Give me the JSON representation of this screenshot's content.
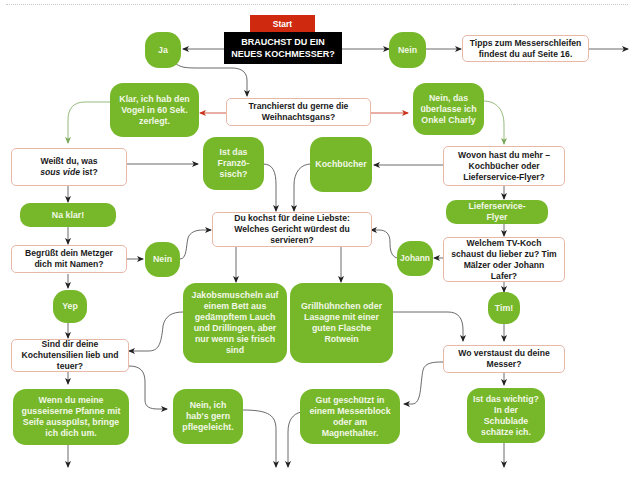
{
  "flowchart": {
    "start_label": "Start",
    "main_question": "BRAUCHST DU EIN NEUES KOCHMESSER?",
    "colors": {
      "start": "#cf2a10",
      "main_question_bg": "#000000",
      "answer_bubble": "#76b82a",
      "question_border": "#e9b7a8",
      "arrow": "#333333",
      "arrow_red": "#c8331a",
      "arrow_green": "#7aa85a"
    },
    "nodes": {
      "ja": "Ja",
      "nein_top": "Nein",
      "tipps": "Tipps zum Messerschleifen findest du auf Seite 16.",
      "tranchierst": "Tranchierst du gerne die Weihnachtsgans?",
      "klar_vogel": "Klar, ich hab den Vogel in 60 Sek. zerlegt.",
      "nein_onkel": "Nein, das überlasse ich Onkel Charly",
      "weisst_du_pre": "Weißt du, was",
      "weisst_du_italic": "sous vide",
      "weisst_du_post": "ist?",
      "ist_das_franzoesisch": "Ist das Franzö-sisch?",
      "kochbuecher": "Kochbücher",
      "wovon_hast_du": "Wovon hast du mehr – Kochbücher oder Lieferservice-Flyer?",
      "na_klar": "Na klar!",
      "du_kochst": "Du kochst für deine Liebste: Welches Gericht würdest du servieren?",
      "lieferservice_flyer": "Lieferservice-Flyer",
      "begruesst": "Begrüßt dein Metzger dich mit Namen?",
      "nein_metzger": "Nein",
      "johann": "Johann",
      "welchem_tv_koch": "Welchem TV-Koch schaust du lieber zu? Tim Mälzer oder Johann Lafer?",
      "yep": "Yep",
      "jakobsmuscheln": "Jakobsmuscheln auf einem Bett aus gedämpftem Lauch und Drillingen, aber nur wenn sie frisch sind",
      "grillhuehnchen": "Grillhühnchen oder Lasagne mit einer guten Flasche Rotwein",
      "tim": "Tim!",
      "sind_dir": "Sind dir deine Kochutensilien lieb und teuer?",
      "wo_verstaust": "Wo verstaust du deine Messer?",
      "wenn_du_meine": "Wenn du meine gusseiserne Pfanne mit Seife ausspülst, bringe ich dich um.",
      "nein_pflegeleicht": "Nein, ich hab's gern pflegeleicht.",
      "gut_geschuetzt": "Gut geschützt in einem Messerblock oder am Magnethalter.",
      "ist_das_wichtig": "Ist das wichtig? In der Schublade schätze ich."
    }
  }
}
